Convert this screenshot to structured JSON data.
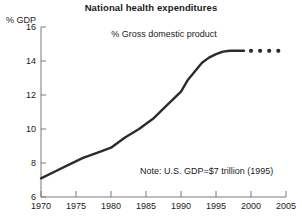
{
  "chart_data": {
    "type": "line",
    "title": "National health expenditures",
    "subtitle": "% Gross domestic product",
    "ylabel": "% GDP",
    "xlabel": "",
    "note": "Note:  U.S. GDP=$7 trillion (1995)",
    "xlim": [
      1970,
      2005
    ],
    "ylim": [
      6,
      16
    ],
    "grid": false,
    "legend": null,
    "xticks": [
      1970,
      1975,
      1980,
      1985,
      1990,
      1995,
      2000,
      2005
    ],
    "yticks": [
      6,
      8,
      10,
      12,
      14,
      16
    ],
    "series": [
      {
        "name": "National health expenditures (% of GDP) - actual",
        "style": "solid",
        "color": "#2b2b2b",
        "x": [
          1970,
          1972,
          1974,
          1976,
          1978,
          1980,
          1982,
          1984,
          1986,
          1988,
          1990,
          1991,
          1992,
          1993,
          1994,
          1995,
          1996,
          1997,
          1998,
          1999
        ],
        "y": [
          7.1,
          7.5,
          7.9,
          8.3,
          8.6,
          8.9,
          9.5,
          10.0,
          10.6,
          11.4,
          12.2,
          12.9,
          13.4,
          13.9,
          14.2,
          14.4,
          14.55,
          14.6,
          14.6,
          14.6
        ]
      },
      {
        "name": "National health expenditures (% of GDP) - projected",
        "style": "dotted",
        "color": "#2b2b2b",
        "x": [
          2000,
          2001.3,
          2002.6,
          2003.9
        ],
        "y": [
          14.6,
          14.6,
          14.6,
          14.6
        ]
      }
    ]
  },
  "axis": {
    "y_tick_labels": [
      "16",
      "14",
      "12",
      "10",
      "8",
      "6"
    ],
    "x_tick_labels": [
      "1970",
      "1975",
      "1980",
      "1985",
      "1990",
      "1995",
      "2000",
      "2005"
    ]
  },
  "colors": {
    "line": "#2b2b2b",
    "axis": "#7a7a7a",
    "text": "#1a1a1a",
    "background": "#ffffff"
  }
}
